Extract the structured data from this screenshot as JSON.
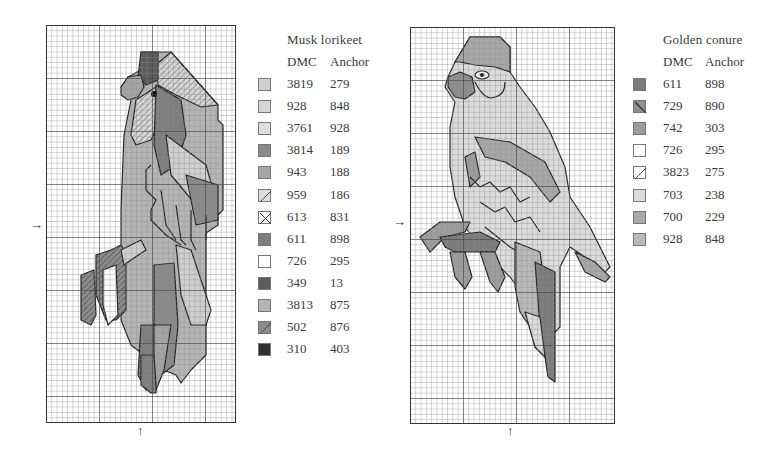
{
  "left_chart": {
    "title": "Musk lorikeet",
    "headers": {
      "dmc": "DMC",
      "anchor": "Anchor"
    },
    "rows": [
      {
        "dmc": "3819",
        "anchor": "279",
        "color": "#cfcfcf",
        "pattern": "solid"
      },
      {
        "dmc": "928",
        "anchor": "848",
        "color": "#d6d6d6",
        "pattern": "solid"
      },
      {
        "dmc": "3761",
        "anchor": "928",
        "color": "#dedede",
        "pattern": "solid"
      },
      {
        "dmc": "3814",
        "anchor": "189",
        "color": "#8a8a8a",
        "pattern": "solid"
      },
      {
        "dmc": "943",
        "anchor": "188",
        "color": "#a5a5a5",
        "pattern": "solid"
      },
      {
        "dmc": "959",
        "anchor": "186",
        "color": "#dcdcdc",
        "pattern": "diagonal"
      },
      {
        "dmc": "613",
        "anchor": "831",
        "color": "#ffffff",
        "pattern": "cross"
      },
      {
        "dmc": "611",
        "anchor": "898",
        "color": "#7e7e7e",
        "pattern": "solid"
      },
      {
        "dmc": "726",
        "anchor": "295",
        "color": "#ffffff",
        "pattern": "solid"
      },
      {
        "dmc": "349",
        "anchor": "13",
        "color": "#5c5c5c",
        "pattern": "solid"
      },
      {
        "dmc": "3813",
        "anchor": "875",
        "color": "#b5b5b5",
        "pattern": "solid"
      },
      {
        "dmc": "502",
        "anchor": "876",
        "color": "#8c8c8c",
        "pattern": "diagonal"
      },
      {
        "dmc": "310",
        "anchor": "403",
        "color": "#2e2e2e",
        "pattern": "solid"
      }
    ],
    "center_arrow_left": "→",
    "center_arrow_bottom": "↑"
  },
  "right_chart": {
    "title": "Golden conure",
    "headers": {
      "dmc": "DMC",
      "anchor": "Anchor"
    },
    "rows": [
      {
        "dmc": "611",
        "anchor": "898",
        "color": "#7b7b7b",
        "pattern": "solid"
      },
      {
        "dmc": "729",
        "anchor": "890",
        "color": "#8e8e8e",
        "pattern": "backslash"
      },
      {
        "dmc": "742",
        "anchor": "303",
        "color": "#9d9d9d",
        "pattern": "solid"
      },
      {
        "dmc": "726",
        "anchor": "295",
        "color": "#ffffff",
        "pattern": "solid"
      },
      {
        "dmc": "3823",
        "anchor": "275",
        "color": "#ffffff",
        "pattern": "diagonal"
      },
      {
        "dmc": "703",
        "anchor": "238",
        "color": "#dcdcdc",
        "pattern": "solid"
      },
      {
        "dmc": "700",
        "anchor": "229",
        "color": "#a8a8a8",
        "pattern": "solid"
      },
      {
        "dmc": "928",
        "anchor": "848",
        "color": "#b9b9b9",
        "pattern": "solid"
      }
    ],
    "center_arrow_left": "→",
    "center_arrow_bottom": "↑"
  }
}
